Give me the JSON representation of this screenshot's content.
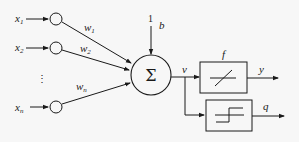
{
  "diagram": {
    "title": "",
    "type": "artificial neuron (perceptron) model",
    "inputs": [
      {
        "label": "x",
        "sub": "1",
        "weight_label": "w",
        "weight_sub": "1"
      },
      {
        "label": "x",
        "sub": "2",
        "weight_label": "w",
        "weight_sub": "2"
      },
      {
        "label": "x",
        "sub": "n",
        "weight_label": "w",
        "weight_sub": "n"
      }
    ],
    "ellipsis": "⋮",
    "bias": {
      "input": "1",
      "label": "b"
    },
    "summation": {
      "symbol": "Σ"
    },
    "net_output": {
      "label": "v"
    },
    "blocks": [
      {
        "name": "activation",
        "label": "f",
        "icon": "linear-ramp-icon",
        "output": "y"
      },
      {
        "name": "quantizer",
        "label": "",
        "icon": "step-function-icon",
        "output": "q"
      }
    ],
    "colors": {
      "line": "#1a1a1a",
      "background": "#f7f7f7"
    }
  }
}
